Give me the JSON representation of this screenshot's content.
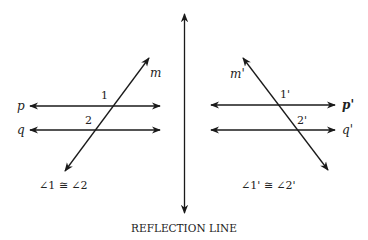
{
  "left_figure": {
    "transversal_label": "m",
    "line_p_label": "p",
    "line_q_label": "q",
    "angle1_label": "1",
    "angle2_label": "2",
    "statement": "∠1 ≅ ∠2"
  },
  "right_figure": {
    "transversal_label": "m'",
    "line_p_label": "p'",
    "line_q_label": "q'",
    "angle1_label": "1'",
    "angle2_label": "2'",
    "statement": "∠1' ≅ ∠2'"
  },
  "reflection_line_label": "REFLECTION LINE",
  "colors": {
    "line": "#1a1a1a",
    "background": "#ffffff"
  }
}
